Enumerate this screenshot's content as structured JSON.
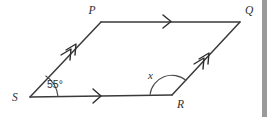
{
  "figure": {
    "type": "parallelogram-angle-diagram",
    "background_color": "#ffffff",
    "line_color": "#3a3a3a",
    "label_color": "#2e2e2e",
    "vertices": [
      {
        "name": "P",
        "label": "P",
        "x": 101,
        "y": 22,
        "label_x": 92,
        "label_y": 14
      },
      {
        "name": "Q",
        "label": "Q",
        "x": 240,
        "y": 22,
        "label_x": 245,
        "label_y": 14
      },
      {
        "name": "R",
        "label": "R",
        "x": 172,
        "y": 95,
        "label_x": 177,
        "label_y": 108
      },
      {
        "name": "S",
        "label": "S",
        "x": 30,
        "y": 97,
        "label_x": 12,
        "label_y": 101
      }
    ],
    "sides": [
      {
        "name": "side-PQ",
        "from": "P",
        "to": "Q",
        "tick_marks": 1
      },
      {
        "name": "side-QR",
        "from": "R",
        "to": "Q",
        "tick_marks": 2
      },
      {
        "name": "side-SR",
        "from": "S",
        "to": "R",
        "tick_marks": 1
      },
      {
        "name": "side-SP",
        "from": "S",
        "to": "P",
        "tick_marks": 2
      }
    ],
    "angles": [
      {
        "name": "angle-at-S",
        "vertex": "S",
        "label": "55°",
        "label_x": 47,
        "label_y": 88,
        "style": "arc"
      },
      {
        "name": "angle-at-R",
        "vertex": "R",
        "label": "x",
        "label_x": 148,
        "label_y": 79,
        "style": "arc"
      }
    ],
    "scrollbar": {
      "name": "right-scrollbar-strip",
      "color": "#9a9a9a"
    }
  }
}
